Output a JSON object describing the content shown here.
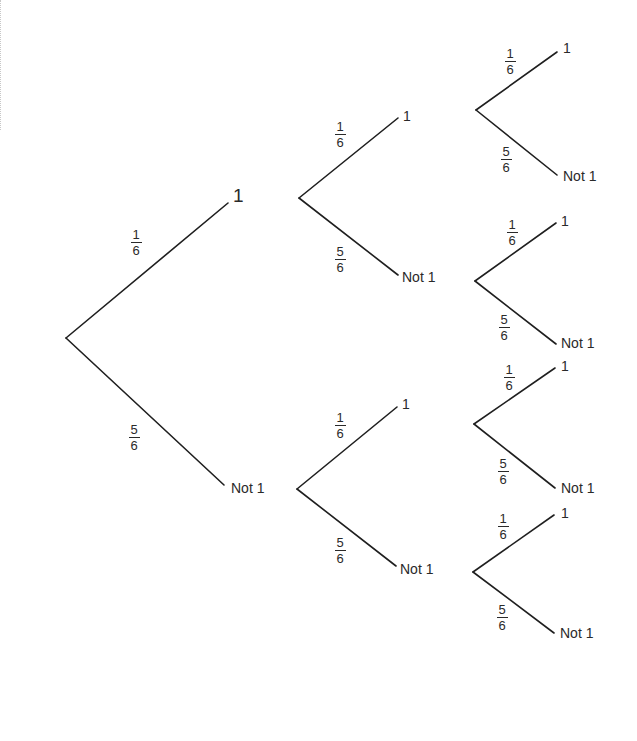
{
  "diagram": {
    "type": "probability-tree",
    "line_color": "#1f1f1f",
    "text_color": "#2a2a2a",
    "background": "#ffffff",
    "root": {
      "x": 66,
      "y": 338
    },
    "level1": [
      {
        "id": "L1-1",
        "label": "1",
        "prob": {
          "num": "1",
          "den": "6"
        },
        "from": [
          66,
          338
        ],
        "to": [
          228,
          203
        ]
      },
      {
        "id": "L1-not1",
        "label": "Not 1",
        "prob": {
          "num": "5",
          "den": "6"
        },
        "from": [
          66,
          338
        ],
        "to": [
          224,
          485
        ]
      }
    ],
    "level2": [
      {
        "id": "L2-1-1",
        "label": "1",
        "prob": {
          "num": "1",
          "den": "6"
        },
        "from": [
          299,
          198
        ],
        "to": [
          398,
          118
        ]
      },
      {
        "id": "L2-1-not1",
        "label": "Not 1",
        "prob": {
          "num": "5",
          "den": "6"
        },
        "from": [
          299,
          198
        ],
        "to": [
          398,
          275
        ]
      },
      {
        "id": "L2-not1-1",
        "label": "1",
        "prob": {
          "num": "1",
          "den": "6"
        },
        "from": [
          297,
          489
        ],
        "to": [
          397,
          407
        ]
      },
      {
        "id": "L2-not1-not1",
        "label": "Not 1",
        "prob": {
          "num": "5",
          "den": "6"
        },
        "from": [
          297,
          489
        ],
        "to": [
          396,
          566
        ]
      }
    ],
    "level3": [
      {
        "id": "L3-a-1",
        "label": "1",
        "prob": {
          "num": "1",
          "den": "6"
        },
        "from": [
          476,
          110
        ],
        "to": [
          557,
          52
        ]
      },
      {
        "id": "L3-a-not1",
        "label": "Not 1",
        "prob": {
          "num": "5",
          "den": "6"
        },
        "from": [
          476,
          110
        ],
        "to": [
          557,
          175
        ]
      },
      {
        "id": "L3-b-1",
        "label": "1",
        "prob": {
          "num": "1",
          "den": "6"
        },
        "from": [
          475,
          281
        ],
        "to": [
          556,
          223
        ]
      },
      {
        "id": "L3-b-not1",
        "label": "Not 1",
        "prob": {
          "num": "5",
          "den": "6"
        },
        "from": [
          475,
          281
        ],
        "to": [
          556,
          344
        ]
      },
      {
        "id": "L3-c-1",
        "label": "1",
        "prob": {
          "num": "1",
          "den": "6"
        },
        "from": [
          474,
          424
        ],
        "to": [
          555,
          368
        ]
      },
      {
        "id": "L3-c-not1",
        "label": "Not 1",
        "prob": {
          "num": "5",
          "den": "6"
        },
        "from": [
          474,
          424
        ],
        "to": [
          555,
          488
        ]
      },
      {
        "id": "L3-d-1",
        "label": "1",
        "prob": {
          "num": "1",
          "den": "6"
        },
        "from": [
          473,
          572
        ],
        "to": [
          554,
          515
        ]
      },
      {
        "id": "L3-d-not1",
        "label": "Not 1",
        "prob": {
          "num": "5",
          "den": "6"
        },
        "from": [
          473,
          572
        ],
        "to": [
          554,
          633
        ]
      }
    ]
  }
}
